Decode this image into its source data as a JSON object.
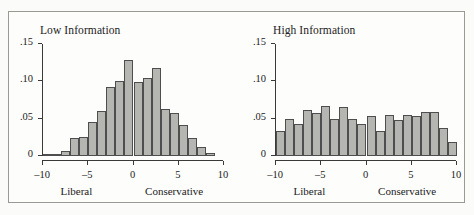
{
  "figure": {
    "background_color": "#fbfbfa",
    "frame_color": "#9a9a95",
    "bar_fill_color": "#b5b5b2",
    "bar_edge_color": "#4e4e4e",
    "axis_color": "#3a3a3a"
  },
  "chart_data": [
    {
      "type": "bar",
      "title": "Low Information",
      "xlabel": "",
      "ylabel": "",
      "xlim": [
        -10,
        10
      ],
      "ylim": [
        0,
        0.15
      ],
      "grid": false,
      "legend": "none",
      "xticks": [
        -10,
        -5,
        0,
        5,
        10
      ],
      "xtick_labels": [
        "–10",
        "–5",
        "0",
        "5",
        "10"
      ],
      "yticks": [
        0,
        0.05,
        0.1,
        0.15
      ],
      "ytick_labels": [
        "0",
        ".05",
        ".10",
        ".15"
      ],
      "pole_labels": [
        {
          "text": "Liberal",
          "x": -6.2
        },
        {
          "text": "Conservative",
          "x": 4.6
        }
      ],
      "bin_width": 1.0,
      "bin_centers": [
        -9.5,
        -8.5,
        -7.5,
        -6.5,
        -5.5,
        -4.5,
        -3.5,
        -2.5,
        -1.5,
        -0.5,
        0.5,
        1.5,
        2.5,
        3.5,
        4.5,
        5.5,
        6.5,
        7.5,
        8.5
      ],
      "values": [
        0.003,
        0.003,
        0.007,
        0.024,
        0.025,
        0.046,
        0.06,
        0.092,
        0.101,
        0.129,
        0.099,
        0.104,
        0.118,
        0.063,
        0.057,
        0.041,
        0.024,
        0.012,
        0.004,
        0.005
      ]
    },
    {
      "type": "bar",
      "title": "High Information",
      "xlabel": "",
      "ylabel": "",
      "xlim": [
        -10,
        10
      ],
      "ylim": [
        0,
        0.15
      ],
      "grid": false,
      "legend": "none",
      "xticks": [
        -10,
        -5,
        0,
        5,
        10
      ],
      "xtick_labels": [
        "–10",
        "–5",
        "0",
        "5",
        "10"
      ],
      "yticks": [
        0,
        0.05,
        0.1,
        0.15
      ],
      "ytick_labels": [
        "0",
        ".05",
        ".10",
        ".15"
      ],
      "pole_labels": [
        {
          "text": "Liberal",
          "x": -6.2
        },
        {
          "text": "Conservative",
          "x": 4.6
        }
      ],
      "bin_width": 1.0,
      "bin_centers": [
        -9.5,
        -8.5,
        -7.5,
        -6.5,
        -5.5,
        -4.5,
        -3.5,
        -2.5,
        -1.5,
        -0.5,
        0.5,
        1.5,
        2.5,
        3.5,
        4.5,
        5.5,
        6.5,
        7.5,
        8.5,
        9.5
      ],
      "values": [
        0.033,
        0.05,
        0.043,
        0.062,
        0.058,
        0.067,
        0.05,
        0.065,
        0.049,
        0.043,
        0.053,
        0.033,
        0.055,
        0.048,
        0.055,
        0.054,
        0.059,
        0.059,
        0.038,
        0.019,
        0.009
      ]
    }
  ]
}
